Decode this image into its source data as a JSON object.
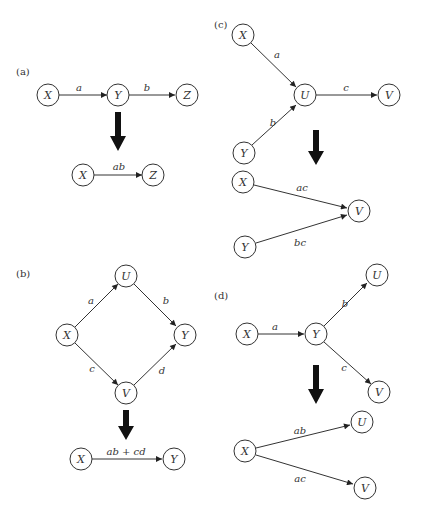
{
  "panels": {
    "a": {
      "label": "(a)",
      "before": {
        "nodes": [
          "X",
          "Y",
          "Z"
        ],
        "edges": [
          {
            "from": "X",
            "to": "Y",
            "label": "a"
          },
          {
            "from": "Y",
            "to": "Z",
            "label": "b"
          }
        ]
      },
      "after": {
        "nodes": [
          "X",
          "Z"
        ],
        "edges": [
          {
            "from": "X",
            "to": "Z",
            "label": "ab"
          }
        ]
      }
    },
    "b": {
      "label": "(b)",
      "before": {
        "nodes": [
          "X",
          "U",
          "V",
          "Y"
        ],
        "edges": [
          {
            "from": "X",
            "to": "U",
            "label": "a"
          },
          {
            "from": "U",
            "to": "Y",
            "label": "b"
          },
          {
            "from": "X",
            "to": "V",
            "label": "c"
          },
          {
            "from": "V",
            "to": "Y",
            "label": "d"
          }
        ]
      },
      "after": {
        "nodes": [
          "X",
          "Y"
        ],
        "edges": [
          {
            "from": "X",
            "to": "Y",
            "label": "ab + cd"
          }
        ]
      }
    },
    "c": {
      "label": "(c)",
      "before": {
        "nodes": [
          "X",
          "Y",
          "U",
          "V"
        ],
        "edges": [
          {
            "from": "X",
            "to": "U",
            "label": "a"
          },
          {
            "from": "Y",
            "to": "U",
            "label": "b"
          },
          {
            "from": "U",
            "to": "V",
            "label": "c"
          }
        ]
      },
      "after": {
        "nodes": [
          "X",
          "Y",
          "V"
        ],
        "edges": [
          {
            "from": "X",
            "to": "V",
            "label": "ac"
          },
          {
            "from": "Y",
            "to": "V",
            "label": "bc"
          }
        ]
      }
    },
    "d": {
      "label": "(d)",
      "before": {
        "nodes": [
          "X",
          "Y",
          "U",
          "V"
        ],
        "edges": [
          {
            "from": "X",
            "to": "Y",
            "label": "a"
          },
          {
            "from": "Y",
            "to": "U",
            "label": "b"
          },
          {
            "from": "Y",
            "to": "V",
            "label": "c"
          }
        ]
      },
      "after": {
        "nodes": [
          "X",
          "U",
          "V"
        ],
        "edges": [
          {
            "from": "X",
            "to": "U",
            "label": "ab"
          },
          {
            "from": "X",
            "to": "V",
            "label": "ac"
          }
        ]
      }
    }
  }
}
